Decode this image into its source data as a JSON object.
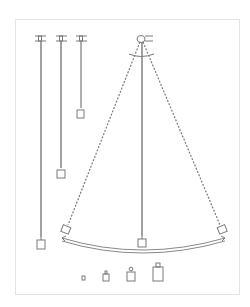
{
  "figure": {
    "caption": "",
    "colors": {
      "line": "#7a7a7a",
      "frame": "#e4e4e4",
      "bob": "#555555"
    },
    "pendulums_left": [
      {
        "name": "long",
        "x": 40,
        "bob_y": 243
      },
      {
        "name": "medium",
        "x": 61,
        "bob_y": 173
      },
      {
        "name": "short",
        "x": 81,
        "bob_y": 113
      }
    ],
    "main_pendulum": {
      "pivot": [
        141,
        38
      ],
      "rest_bob": [
        142,
        243
      ],
      "left_bob": [
        66,
        229
      ],
      "right_bob": [
        222,
        229
      ]
    },
    "weights": [
      {
        "x": 83,
        "size": "tiny"
      },
      {
        "x": 106,
        "size": "small"
      },
      {
        "x": 131,
        "size": "medium"
      },
      {
        "x": 158,
        "size": "large"
      }
    ]
  }
}
